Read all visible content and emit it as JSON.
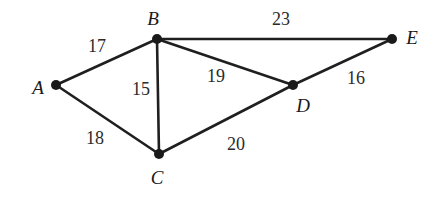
{
  "figure": {
    "kind": "weighted-undirected-graph",
    "width": 434,
    "height": 199,
    "background_color": "#ffffff",
    "edge_color": "#1f1f1f",
    "node_color": "#1a1a1a",
    "label_color": "#1a1a1a",
    "weight_color": "#2b2b2b"
  },
  "chart_data": {
    "type": "diagram",
    "title": "",
    "xlabel": "",
    "ylabel": "",
    "nodes": [
      {
        "id": "A",
        "label": "A",
        "x": 56,
        "y": 85,
        "label_x": 38,
        "label_y": 87
      },
      {
        "id": "B",
        "label": "B",
        "x": 157,
        "y": 39,
        "label_x": 153,
        "label_y": 18
      },
      {
        "id": "C",
        "label": "C",
        "x": 159,
        "y": 154,
        "label_x": 157,
        "label_y": 177
      },
      {
        "id": "D",
        "label": "D",
        "x": 293,
        "y": 85,
        "label_x": 303,
        "label_y": 105
      },
      {
        "id": "E",
        "label": "E",
        "x": 392,
        "y": 39,
        "label_x": 412,
        "label_y": 37
      }
    ],
    "edges": [
      {
        "source": "A",
        "target": "B",
        "weight": 17,
        "label": "17",
        "label_x": 97,
        "label_y": 46
      },
      {
        "source": "A",
        "target": "C",
        "weight": 18,
        "label": "18",
        "label_x": 95,
        "label_y": 138
      },
      {
        "source": "B",
        "target": "C",
        "weight": 15,
        "label": "15",
        "label_x": 141,
        "label_y": 89
      },
      {
        "source": "B",
        "target": "D",
        "weight": 19,
        "label": "19",
        "label_x": 216,
        "label_y": 76
      },
      {
        "source": "B",
        "target": "E",
        "weight": 23,
        "label": "23",
        "label_x": 281,
        "label_y": 19
      },
      {
        "source": "C",
        "target": "D",
        "weight": 20,
        "label": "20",
        "label_x": 236,
        "label_y": 144
      },
      {
        "source": "D",
        "target": "E",
        "weight": 16,
        "label": "16",
        "label_x": 356,
        "label_y": 78
      }
    ]
  }
}
